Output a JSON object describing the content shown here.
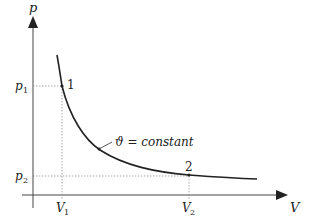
{
  "diagram": {
    "type": "p-V isotherm diagram",
    "axes": {
      "y_label": "p",
      "x_label": "V"
    },
    "ticks": {
      "y": [
        {
          "base": "p",
          "sub": "1"
        },
        {
          "base": "p",
          "sub": "2"
        }
      ],
      "x": [
        {
          "base": "V",
          "sub": "1"
        },
        {
          "base": "V",
          "sub": "2"
        }
      ]
    },
    "points": [
      {
        "label": "1"
      },
      {
        "label": "2"
      }
    ],
    "curve_label": {
      "symbol": "ϑ",
      "text": " = constant"
    },
    "colors": {
      "curve": "#222222",
      "axis": "#333333",
      "guide": "#888888"
    }
  }
}
